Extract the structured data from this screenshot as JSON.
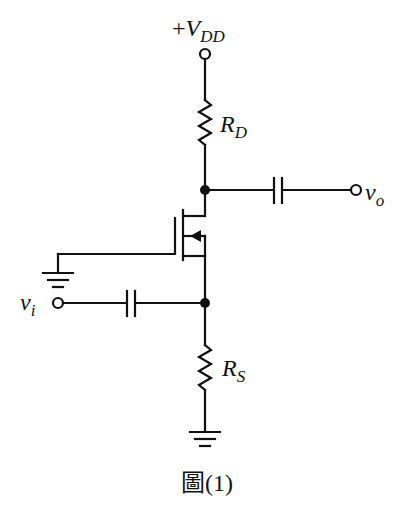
{
  "diagram": {
    "type": "circuit-schematic",
    "supply": {
      "prefix": "+",
      "symbol": "V",
      "subscript": "DD"
    },
    "drain_resistor": {
      "symbol": "R",
      "subscript": "D"
    },
    "source_resistor": {
      "symbol": "R",
      "subscript": "S"
    },
    "output": {
      "symbol": "v",
      "subscript": "o"
    },
    "input": {
      "symbol": "v",
      "subscript": "i"
    },
    "caption": "圖(1)",
    "components": [
      "VDD terminal",
      "RD resistor",
      "NMOS transistor (gate grounded)",
      "output coupling capacitor",
      "input coupling capacitor",
      "RS resistor",
      "ground (gate)",
      "ground (source resistor)"
    ],
    "colors": {
      "ink": "#111111",
      "background": "#ffffff"
    }
  }
}
